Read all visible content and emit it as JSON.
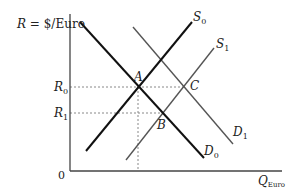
{
  "diagram": {
    "y_axis_label": "R = $/Euro",
    "y_axis_label_parts": {
      "var": "R",
      "rest": " = $/Euro"
    },
    "x_axis_label": {
      "main": "Q",
      "sub": "Euro"
    },
    "origin_label": "0",
    "y_ticks": [
      {
        "id": "R0",
        "main": "R",
        "sub": "0"
      },
      {
        "id": "R1",
        "main": "R",
        "sub": "1"
      }
    ],
    "curves": [
      {
        "id": "S0",
        "main": "S",
        "sub": "0",
        "type": "supply",
        "color": "#111111",
        "weight": 2
      },
      {
        "id": "S1",
        "main": "S",
        "sub": "1",
        "type": "supply",
        "color": "#555555",
        "weight": 1.4
      },
      {
        "id": "D0",
        "main": "D",
        "sub": "0",
        "type": "demand",
        "color": "#111111",
        "weight": 2
      },
      {
        "id": "D1",
        "main": "D",
        "sub": "1",
        "type": "demand",
        "color": "#555555",
        "weight": 1.4
      }
    ],
    "points": [
      {
        "id": "A",
        "label": "A",
        "description": "S0 ∩ D0 at R0"
      },
      {
        "id": "B",
        "label": "B",
        "description": "S1 ∩ D0 at R1"
      },
      {
        "id": "C",
        "label": "C",
        "description": "S1 ∩ D1 at R0"
      }
    ],
    "colors": {
      "axis": "#444444",
      "dashed": "#888888",
      "text": "#222222"
    }
  }
}
